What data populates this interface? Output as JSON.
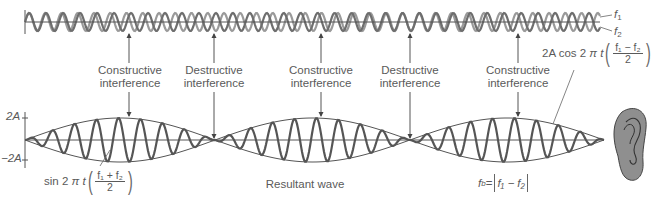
{
  "top_waves": {
    "labels": {
      "f1": "f",
      "f1_sub": "1",
      "f2": "f",
      "f2_sub": "2"
    },
    "colors": {
      "f1": "#8a8a8a",
      "f2": "#6a6a6a",
      "axis": "#555555"
    }
  },
  "interference_labels": [
    {
      "line1": "Constructive",
      "line2": "interference",
      "x": 129
    },
    {
      "line1": "Destructive",
      "line2": "interference",
      "x": 214
    },
    {
      "line1": "Constructive",
      "line2": "interference",
      "x": 321
    },
    {
      "line1": "Destructive",
      "line2": "interference",
      "x": 410
    },
    {
      "line1": "Constructive",
      "line2": "interference",
      "x": 518
    }
  ],
  "axis": {
    "top": "2A",
    "bottom": "−2A"
  },
  "envelope_formula": {
    "prefix": "2A cos 2",
    "pi": "π",
    "t": "t",
    "num": "f₁ − f₂",
    "den": "2"
  },
  "carrier_formula": {
    "prefix": "sin 2",
    "pi": "π",
    "t": "t",
    "num": "f₁ + f₂",
    "den": "2"
  },
  "resultant_label": "Resultant wave",
  "beat_formula": {
    "lhs": "f",
    "lhs_sub": "b",
    "eq": " = ",
    "body": "f₁ − f₂"
  },
  "ear_icon": "ear-icon"
}
